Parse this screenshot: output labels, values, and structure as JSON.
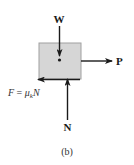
{
  "diagram": {
    "caption": "(b)",
    "block": {
      "fill": "#d6d6d6",
      "stroke": "#999999"
    },
    "forces": {
      "weight": {
        "label": "W",
        "direction": "down"
      },
      "push": {
        "label": "P",
        "direction": "right"
      },
      "normal": {
        "label": "N",
        "direction": "up"
      },
      "friction": {
        "label_F": "F",
        "label_eq": " = ",
        "label_mu": "μ",
        "label_sub": "k",
        "label_N": "N",
        "direction": "left"
      }
    },
    "colors": {
      "arrow": "#1a1a1a"
    }
  }
}
